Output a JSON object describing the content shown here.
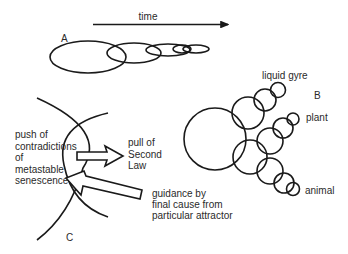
{
  "panel_a": {
    "label": "A",
    "time_axis_label": "time"
  },
  "panel_b": {
    "label": "B",
    "branches": {
      "top": "liquid gyre",
      "middle": "plant",
      "bottom": "animal"
    }
  },
  "panel_c": {
    "label": "C",
    "push_text": [
      "push of",
      "contradictions",
      "of",
      "metastable",
      "senescence"
    ],
    "pull_text": [
      "pull of",
      "Second",
      "Law"
    ],
    "guidance_text": [
      "guidance by",
      "final cause from",
      "particular attractor"
    ]
  }
}
